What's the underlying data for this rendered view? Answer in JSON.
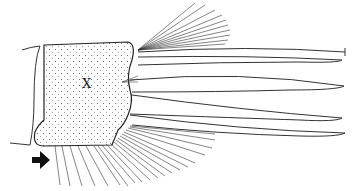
{
  "figure": {
    "type": "scientific line illustration",
    "labels": {
      "segment_mark": "X"
    },
    "arrow": {
      "direction": "right",
      "color": "#111111"
    },
    "colors": {
      "ink": "#222222",
      "background": "#ffffff",
      "stipple": "#555555"
    }
  }
}
